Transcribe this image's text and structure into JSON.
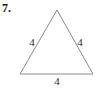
{
  "figure": {
    "problem_number": "7.",
    "shape": "equilateral-triangle",
    "stroke_color": "#8a8a8a",
    "label_color": "#2b2b2b",
    "background_color": "#ffffff",
    "vertices": {
      "apex": [
        57,
        10
      ],
      "bottom_left": [
        20,
        74
      ],
      "bottom_right": [
        93,
        74
      ]
    },
    "side_labels": {
      "left": "4",
      "right": "4",
      "bottom": "4"
    }
  }
}
